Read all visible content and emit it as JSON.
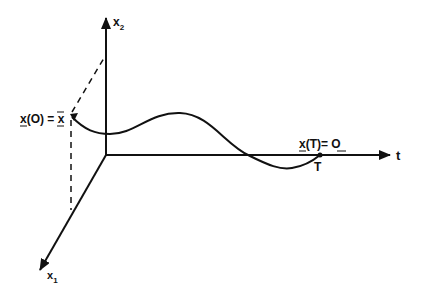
{
  "diagram": {
    "type": "3D state trajectory plot",
    "colors": {
      "stroke": "#111111",
      "background": "#ffffff"
    },
    "axes": {
      "x2": {
        "label": "x",
        "subscript": "2"
      },
      "x1": {
        "label": "x",
        "subscript": "1"
      },
      "t": {
        "label": "t"
      }
    },
    "labels": {
      "initial_state": {
        "lhs": "x",
        "arg": "(O)",
        "eq": " = ",
        "rhs": "x"
      },
      "final_state": {
        "lhs": "x",
        "arg": "(T)",
        "eq": "= ",
        "rhs": "O"
      },
      "final_time": "T"
    }
  }
}
